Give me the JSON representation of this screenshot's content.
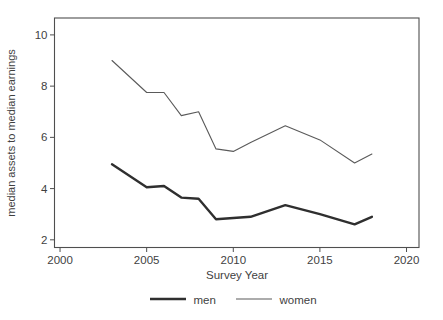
{
  "figure": {
    "background": "#ffffff",
    "width": 443,
    "height": 320
  },
  "chart_data": {
    "type": "line",
    "title": "",
    "xlabel": "Survey Year",
    "ylabel": "median assets to median earnings",
    "x": [
      2003,
      2005,
      2006,
      2007,
      2008,
      2009,
      2010,
      2011,
      2013,
      2015,
      2017,
      2018
    ],
    "series": [
      {
        "name": "men",
        "color": "#2f2f2f",
        "stroke_width": 2.4,
        "values": [
          4.95,
          4.05,
          4.1,
          3.65,
          3.6,
          2.8,
          2.85,
          2.9,
          3.35,
          3.0,
          2.6,
          2.9
        ]
      },
      {
        "name": "women",
        "color": "#5a5a5a",
        "stroke_width": 1.1,
        "values": [
          9.0,
          7.75,
          7.75,
          6.85,
          7.0,
          5.55,
          5.45,
          5.8,
          6.45,
          5.9,
          5.0,
          5.35
        ]
      }
    ],
    "xticks": [
      2000,
      2005,
      2010,
      2015,
      2020
    ],
    "yticks": [
      2,
      4,
      6,
      8,
      10
    ],
    "xlim": [
      1999.68,
      2020.72
    ],
    "ylim": [
      1.7,
      10.66
    ],
    "grid": false,
    "legend_position": "bottom-center",
    "axis_color": "#4f4f4f",
    "text_color": "#3f3f3f"
  }
}
